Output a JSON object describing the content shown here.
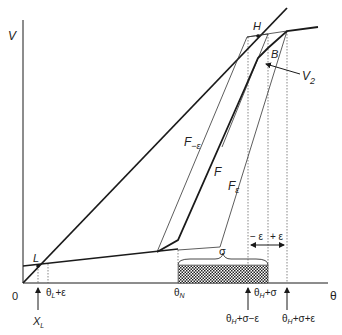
{
  "diagram": {
    "axis_labels": {
      "y": "V",
      "x": "θ",
      "origin": "0"
    },
    "curve_labels": {
      "F": "F",
      "F_minus_eps": "F",
      "F_minus_eps_sub": "−ε",
      "F_eps": "F",
      "F_eps_sub": "ε",
      "V2": "V",
      "V2_sub": "2"
    },
    "point_labels": {
      "L": "L",
      "H": "H",
      "B": "B"
    },
    "interval_labels": {
      "sigma": "σ",
      "minus_eps": "− ε",
      "plus_eps": "+ ε"
    },
    "tick_labels": {
      "theta_L_eps": {
        "main": "θ",
        "sub": "L",
        "rest": "+ε"
      },
      "theta_N": {
        "main": "θ",
        "sub": "N"
      },
      "theta_H_sigma": {
        "main": "θ",
        "sub": "H",
        "rest": "+σ"
      },
      "X_L": {
        "main": "X",
        "sub": "L"
      },
      "theta_H_sigma_minus_eps": {
        "main": "θ",
        "sub": "H",
        "rest": "+σ−ε"
      },
      "theta_H_sigma_plus_eps": {
        "main": "θ",
        "sub": "H",
        "rest": "+σ+ε"
      }
    },
    "colors": {
      "ink": "#1a1a1a",
      "thin": "#333333",
      "dotted": "#555555"
    }
  }
}
